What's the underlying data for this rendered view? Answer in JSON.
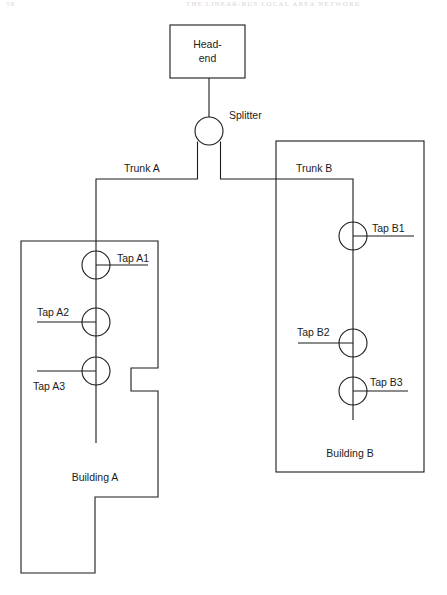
{
  "page": {
    "folio": "58",
    "running_title": "THE LINEAR-BUS LOCAL AREA NETWORK"
  },
  "diagram": {
    "nodes": {
      "headend": {
        "label_line1": "Head-",
        "label_line2": "end"
      },
      "splitter": {
        "label": "Splitter"
      }
    },
    "trunks": [
      {
        "id": "trunk-a",
        "label": "Trunk A"
      },
      {
        "id": "trunk-b",
        "label": "Trunk B"
      }
    ],
    "buildings": [
      {
        "id": "building-a",
        "label": "Building A"
      },
      {
        "id": "building-b",
        "label": "Building B"
      }
    ],
    "taps": [
      {
        "id": "tap-a1",
        "label": "Tap A1",
        "building": "Building A",
        "side": "right"
      },
      {
        "id": "tap-a2",
        "label": "Tap A2",
        "building": "Building A",
        "side": "left"
      },
      {
        "id": "tap-a3",
        "label": "Tap A3",
        "building": "Building A",
        "side": "left"
      },
      {
        "id": "tap-b1",
        "label": "Tap B1",
        "building": "Building B",
        "side": "right"
      },
      {
        "id": "tap-b2",
        "label": "Tap B2",
        "building": "Building B",
        "side": "left"
      },
      {
        "id": "tap-b3",
        "label": "Tap B3",
        "building": "Building B",
        "side": "right"
      }
    ],
    "colors": {
      "line": "#1b1b1b",
      "text": "#1b1b1b",
      "background": "#ffffff"
    }
  }
}
